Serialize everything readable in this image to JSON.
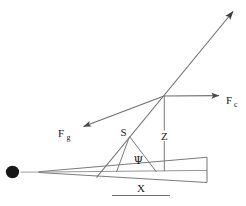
{
  "figure": {
    "background_color": "#ffffff",
    "stroke_color": "#6b6b6b",
    "dark_color": "#1a1a1a",
    "width": 246,
    "height": 206,
    "labels": {
      "force_gravity": "F",
      "force_gravity_sub": "g",
      "force_centrifugal": "F",
      "force_centrifugal_sub": "c",
      "slant": "S",
      "height": "Z",
      "angle": "Ψ",
      "base": "X"
    },
    "elements": {
      "pivot_dot": "pivot-dot",
      "wedge": "tapered-wedge",
      "resultant_arrow": "resultant-force-arrow",
      "fg_arrow": "gravity-force-arrow",
      "fc_arrow": "centrifugal-force-arrow",
      "z_line": "vertical-height-line",
      "s_triangle": "slant-triangle",
      "x_rule": "base-length-rule"
    }
  }
}
